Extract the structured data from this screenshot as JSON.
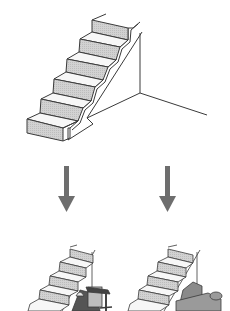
{
  "diagram": {
    "colors": {
      "background": "#ffffff",
      "line": "#3a3a3a",
      "riser_fill": "#cfcfcf",
      "tread_fill": "#f7f7f7",
      "arrow": "#6e6e6e",
      "furniture_dark": "#555555",
      "sofa_fill": "#8a8a8a"
    },
    "top": {
      "label": "empty-understair-staircase",
      "steps": 6
    },
    "arrows": [
      {
        "label": "arrow-left",
        "direction": "down"
      },
      {
        "label": "arrow-right",
        "direction": "down"
      }
    ],
    "bottom": [
      {
        "label": "staircase-with-desk-workspace",
        "steps": 5
      },
      {
        "label": "staircase-with-sofa-seating",
        "steps": 5
      }
    ]
  }
}
